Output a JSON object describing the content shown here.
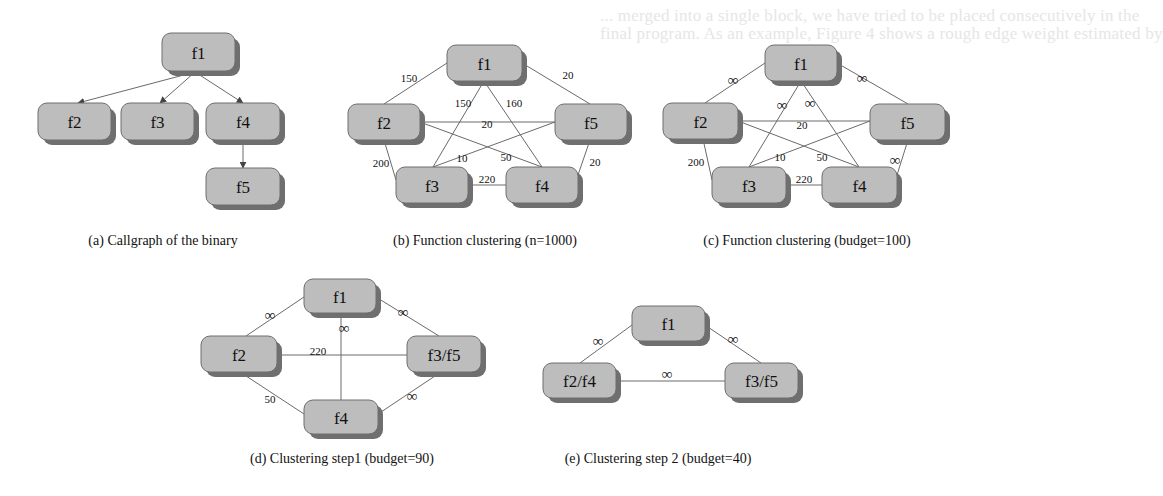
{
  "background_text": [
    {
      "text": "... merged into a single block, we have tried to be placed consecutively in the",
      "x": 0,
      "y": 0
    },
    {
      "text": "final program. As an example, Figure 4 shows a rough edge weight estimated by",
      "x": 0,
      "y": 18
    },
    {
      "text": "the number of the cross block/function edges merged. This approach has proven to",
      "x": 0,
      "y": 36
    }
  ],
  "panels": [
    {
      "id": "a",
      "caption": "(a) Callgraph of the binary",
      "caption_pos": [
        163,
        240
      ],
      "directed": true,
      "nodes": [
        {
          "id": "f1",
          "label": "f1",
          "x": 162,
          "y": 33,
          "w": 73,
          "h": 38
        },
        {
          "id": "f2",
          "label": "f2",
          "x": 38,
          "y": 103,
          "w": 73,
          "h": 37
        },
        {
          "id": "f3",
          "label": "f3",
          "x": 121,
          "y": 103,
          "w": 73,
          "h": 37
        },
        {
          "id": "f4",
          "label": "f4",
          "x": 206,
          "y": 103,
          "w": 74,
          "h": 37
        },
        {
          "id": "f5",
          "label": "f5",
          "x": 206,
          "y": 168,
          "w": 74,
          "h": 37
        }
      ],
      "edges": [
        {
          "from": [
            195,
            72
          ],
          "to": [
            78,
            103
          ],
          "label": ""
        },
        {
          "from": [
            195,
            72
          ],
          "to": [
            160,
            103
          ],
          "label": ""
        },
        {
          "from": [
            195,
            72
          ],
          "to": [
            243,
            103
          ],
          "label": ""
        },
        {
          "from": [
            243,
            140
          ],
          "to": [
            243,
            168
          ],
          "label": ""
        }
      ]
    },
    {
      "id": "b",
      "caption": "(b) Function clustering (n=1000)",
      "caption_pos": [
        485,
        240
      ],
      "directed": false,
      "nodes": [
        {
          "id": "f1",
          "label": "f1",
          "x": 447,
          "y": 45,
          "w": 75,
          "h": 36
        },
        {
          "id": "f2",
          "label": "f2",
          "x": 348,
          "y": 104,
          "w": 72,
          "h": 36
        },
        {
          "id": "f5",
          "label": "f5",
          "x": 555,
          "y": 104,
          "w": 72,
          "h": 36
        },
        {
          "id": "f3",
          "label": "f3",
          "x": 396,
          "y": 167,
          "w": 72,
          "h": 36
        },
        {
          "id": "f4",
          "label": "f4",
          "x": 506,
          "y": 167,
          "w": 72,
          "h": 36
        }
      ],
      "edges": [
        {
          "from": [
            447,
            63
          ],
          "to": [
            384,
            104
          ],
          "label": "150",
          "lx": 409,
          "ly": 78
        },
        {
          "from": [
            522,
            63
          ],
          "to": [
            590,
            104
          ],
          "label": "20",
          "lx": 568,
          "ly": 75
        },
        {
          "from": [
            484,
            81
          ],
          "to": [
            433,
            167
          ],
          "label": "150",
          "lx": 463,
          "ly": 103
        },
        {
          "from": [
            484,
            81
          ],
          "to": [
            542,
            167
          ],
          "label": "160",
          "lx": 514,
          "ly": 103
        },
        {
          "from": [
            420,
            122
          ],
          "to": [
            555,
            122
          ],
          "label": "20",
          "lx": 487,
          "ly": 124
        },
        {
          "from": [
            420,
            122
          ],
          "to": [
            542,
            167
          ],
          "label": "50",
          "lx": 506,
          "ly": 157
        },
        {
          "from": [
            555,
            122
          ],
          "to": [
            433,
            167
          ],
          "label": "10",
          "lx": 462,
          "ly": 158
        },
        {
          "from": [
            384,
            140
          ],
          "to": [
            396,
            180
          ],
          "label": "200",
          "lx": 381,
          "ly": 163
        },
        {
          "from": [
            590,
            140
          ],
          "to": [
            578,
            175
          ],
          "label": "20",
          "lx": 595,
          "ly": 162
        },
        {
          "from": [
            468,
            185
          ],
          "to": [
            506,
            185
          ],
          "label": "220",
          "lx": 487,
          "ly": 179
        }
      ]
    },
    {
      "id": "c",
      "caption": "(c) Function clustering (budget=100)",
      "caption_pos": [
        807,
        240
      ],
      "directed": false,
      "nodes": [
        {
          "id": "f1",
          "label": "f1",
          "x": 765,
          "y": 45,
          "w": 72,
          "h": 36
        },
        {
          "id": "f2",
          "label": "f2",
          "x": 663,
          "y": 103,
          "w": 75,
          "h": 36
        },
        {
          "id": "f5",
          "label": "f5",
          "x": 870,
          "y": 104,
          "w": 75,
          "h": 36
        },
        {
          "id": "f3",
          "label": "f3",
          "x": 712,
          "y": 167,
          "w": 74,
          "h": 36
        },
        {
          "id": "f4",
          "label": "f4",
          "x": 822,
          "y": 167,
          "w": 75,
          "h": 36
        }
      ],
      "edges": [
        {
          "from": [
            765,
            63
          ],
          "to": [
            705,
            103
          ],
          "label": "∞",
          "inf": true,
          "lx": 733,
          "ly": 80
        },
        {
          "from": [
            837,
            63
          ],
          "to": [
            908,
            104
          ],
          "label": "∞",
          "inf": true,
          "lx": 862,
          "ly": 78
        },
        {
          "from": [
            801,
            81
          ],
          "to": [
            749,
            167
          ],
          "label": "∞",
          "inf": true,
          "lx": 782,
          "ly": 105
        },
        {
          "from": [
            801,
            81
          ],
          "to": [
            859,
            167
          ],
          "label": "∞",
          "inf": true,
          "lx": 810,
          "ly": 103
        },
        {
          "from": [
            738,
            121
          ],
          "to": [
            870,
            121
          ],
          "label": "20",
          "lx": 802,
          "ly": 125
        },
        {
          "from": [
            738,
            121
          ],
          "to": [
            859,
            167
          ],
          "label": "50",
          "lx": 822,
          "ly": 157
        },
        {
          "from": [
            870,
            121
          ],
          "to": [
            749,
            167
          ],
          "label": "10",
          "lx": 780,
          "ly": 157
        },
        {
          "from": [
            703,
            139
          ],
          "to": [
            712,
            180
          ],
          "label": "200",
          "lx": 696,
          "ly": 162
        },
        {
          "from": [
            908,
            140
          ],
          "to": [
            897,
            175
          ],
          "label": "∞",
          "inf": true,
          "lx": 895,
          "ly": 160
        },
        {
          "from": [
            786,
            185
          ],
          "to": [
            822,
            185
          ],
          "label": "220",
          "lx": 804,
          "ly": 179
        }
      ]
    },
    {
      "id": "d",
      "caption": "(d) Clustering step1 (budget=90)",
      "caption_pos": [
        342,
        458
      ],
      "directed": false,
      "nodes": [
        {
          "id": "f1",
          "label": "f1",
          "x": 304,
          "y": 279,
          "w": 72,
          "h": 34
        },
        {
          "id": "f2",
          "label": "f2",
          "x": 201,
          "y": 336,
          "w": 76,
          "h": 36
        },
        {
          "id": "f3f5",
          "label": "f3/f5",
          "x": 407,
          "y": 336,
          "w": 74,
          "h": 36
        },
        {
          "id": "f4",
          "label": "f4",
          "x": 304,
          "y": 400,
          "w": 74,
          "h": 34
        }
      ],
      "edges": [
        {
          "from": [
            304,
            297
          ],
          "to": [
            246,
            336
          ],
          "label": "∞",
          "inf": true,
          "lx": 270,
          "ly": 315
        },
        {
          "from": [
            376,
            297
          ],
          "to": [
            439,
            336
          ],
          "label": "∞",
          "inf": true,
          "lx": 403,
          "ly": 312
        },
        {
          "from": [
            341,
            313
          ],
          "to": [
            341,
            400
          ],
          "label": "∞",
          "inf": true,
          "lx": 344,
          "ly": 328
        },
        {
          "from": [
            277,
            355
          ],
          "to": [
            407,
            355
          ],
          "label": "220",
          "lx": 318,
          "ly": 351
        },
        {
          "from": [
            240,
            372
          ],
          "to": [
            304,
            414
          ],
          "label": "50",
          "lx": 270,
          "ly": 399
        },
        {
          "from": [
            441,
            372
          ],
          "to": [
            378,
            414
          ],
          "label": "∞",
          "inf": true,
          "lx": 412,
          "ly": 396
        }
      ]
    },
    {
      "id": "e",
      "caption": "(e) Clustering step 2 (budget=40)",
      "caption_pos": [
        658,
        458
      ],
      "directed": false,
      "nodes": [
        {
          "id": "f1",
          "label": "f1",
          "x": 632,
          "y": 306,
          "w": 73,
          "h": 35
        },
        {
          "id": "f2f4",
          "label": "f2/f4",
          "x": 543,
          "y": 363,
          "w": 73,
          "h": 35
        },
        {
          "id": "f3f5",
          "label": "f3/f5",
          "x": 725,
          "y": 363,
          "w": 73,
          "h": 35
        }
      ],
      "edges": [
        {
          "from": [
            632,
            325
          ],
          "to": [
            580,
            363
          ],
          "label": "∞",
          "inf": true,
          "lx": 598,
          "ly": 341
        },
        {
          "from": [
            705,
            325
          ],
          "to": [
            761,
            363
          ],
          "label": "∞",
          "inf": true,
          "lx": 733,
          "ly": 339
        },
        {
          "from": [
            616,
            381
          ],
          "to": [
            725,
            381
          ],
          "label": "∞",
          "inf": true,
          "lx": 667,
          "ly": 374
        }
      ]
    }
  ]
}
